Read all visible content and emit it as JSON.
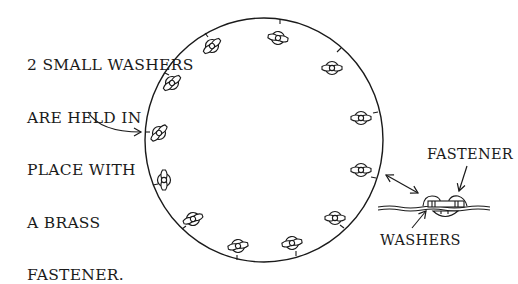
{
  "diagram": {
    "annotation": {
      "lines": [
        "2 SMALL WASHERS",
        "ARE HELD IN",
        "PLACE WITH",
        "A BRASS",
        "FASTENER."
      ]
    },
    "detail": {
      "fastener_label": "FASTENER",
      "washers_label": "WASHERS"
    },
    "circle": {
      "cx": 264,
      "cy": 140,
      "rx": 119,
      "ry": 122,
      "fastener_count": 12
    },
    "colors": {
      "ink": "#1a1a1a",
      "background": "#ffffff"
    }
  }
}
